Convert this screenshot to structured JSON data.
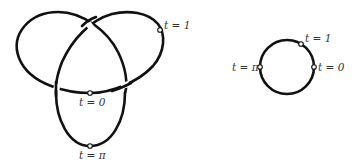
{
  "figure": {
    "left_panel": {
      "description": "trefoil knot curve",
      "markers": [
        {
          "name": "t0",
          "label_var": "t",
          "label_eq": "=",
          "label_val": "0"
        },
        {
          "name": "tpi",
          "label_var": "t",
          "label_eq": "=",
          "label_val": "π"
        },
        {
          "name": "t1",
          "label_var": "t",
          "label_eq": "=",
          "label_val": "1"
        }
      ]
    },
    "right_panel": {
      "description": "circle",
      "markers": [
        {
          "name": "t0",
          "label_var": "t",
          "label_eq": "=",
          "label_val": "0"
        },
        {
          "name": "tpi",
          "label_var": "t",
          "label_eq": "=",
          "label_val": "π"
        },
        {
          "name": "t1",
          "label_var": "t",
          "label_eq": "=",
          "label_val": "1"
        }
      ]
    },
    "labels": {
      "left_t0": "t = 0",
      "left_tpi": "t = π",
      "left_t1": "t = 1",
      "right_t0": "t = 0",
      "right_tpi": "t = π",
      "right_t1": "t = 1"
    },
    "colors": {
      "stroke": "#111111",
      "label": "#333333",
      "background": "#ffffff"
    }
  }
}
